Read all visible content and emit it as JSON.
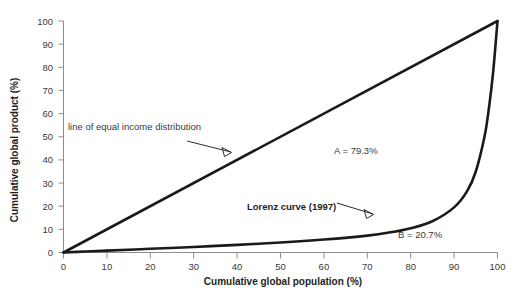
{
  "chart_data": {
    "type": "line",
    "title": "",
    "xlabel": "Cumulative global population (%)",
    "ylabel": "Cumulative global product (%)",
    "xlim": [
      0,
      100
    ],
    "ylim": [
      0,
      100
    ],
    "grid": false,
    "legend_position": "none",
    "xticks": [
      "0",
      "10",
      "20",
      "30",
      "40",
      "50",
      "60",
      "70",
      "80",
      "90",
      "100"
    ],
    "yticks": [
      "0",
      "10",
      "20",
      "30",
      "40",
      "50",
      "60",
      "70",
      "80",
      "90",
      "100"
    ],
    "series": [
      {
        "name": "line of equal income distribution",
        "x": [
          0,
          100
        ],
        "values": [
          0,
          100
        ]
      },
      {
        "name": "Lorenz curve (1997)",
        "x": [
          0,
          5,
          10,
          20,
          30,
          40,
          50,
          60,
          70,
          75,
          80,
          85,
          90,
          93,
          95,
          97,
          98,
          99,
          100
        ],
        "values": [
          0,
          0.4,
          0.8,
          1.6,
          2.4,
          3.3,
          4.3,
          5.6,
          7.3,
          8.6,
          10.5,
          13.5,
          19.5,
          26.5,
          35.0,
          50.0,
          62.0,
          78.0,
          100
        ]
      }
    ],
    "annotations": [
      {
        "id": "equal-line-label",
        "text": "line of equal income distribution",
        "bold": false,
        "x": 9.8,
        "y": 48.6
      },
      {
        "id": "area-a-label",
        "text": "A = 79.3%",
        "bold": false,
        "x": 62.5,
        "y": 43.0
      },
      {
        "id": "lorenz-curve-label",
        "text": "Lorenz curve (1997)",
        "bold": true,
        "x": 42.5,
        "y": 18.2
      },
      {
        "id": "area-b-label",
        "text": "B = 20.7%",
        "bold": false,
        "x": 79.0,
        "y": 6.6
      }
    ],
    "colors": {
      "curve": "#1a1a1a",
      "axis": "#8c8c8c",
      "text": "#231f20",
      "background": "#ffffff"
    }
  }
}
